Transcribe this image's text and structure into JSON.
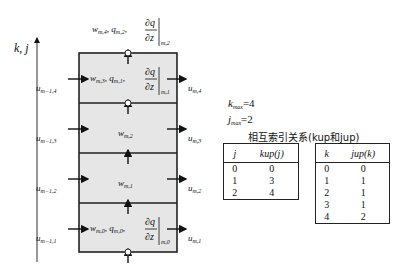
{
  "axis": {
    "label": "k, j"
  },
  "box": {
    "layers": [
      {
        "index": 4,
        "center_label": "w_{m,3}, q_{m,1}, ∂q/∂z|_{m,1}"
      },
      {
        "index": 3,
        "center_label": "w_{m,2}"
      },
      {
        "index": 2,
        "center_label": "w_{m,1}"
      },
      {
        "index": 1,
        "center_label": "w_{m,0}, q_{m,0}, ∂q/∂z|_{m,0}"
      }
    ],
    "top_label": "w_{m,4}, q_{m,2}, ∂q/∂z|_{m,2}"
  },
  "labels": {
    "w_m4": "w",
    "w_m4_sub": "m,4",
    "q_m2": "q",
    "q_m2_sub": "m,2",
    "dq_top_sub": "m,2",
    "w_m3": "w",
    "w_m3_sub": "m,3",
    "q_m1": "q",
    "q_m1_sub": "m,1",
    "dq_mid_sub": "m,1",
    "w_m2": "w",
    "w_m2_sub": "m,2",
    "w_m1": "w",
    "w_m1_sub": "m,1",
    "w_m0": "w",
    "w_m0_sub": "m,0",
    "q_m0": "q",
    "q_m0_sub": "m,0",
    "dq_bot_sub": "m,0",
    "dq_num": "∂q",
    "dq_den": "∂z",
    "comma": ","
  },
  "inflow": [
    {
      "sym": "u",
      "sub": "m−1,4"
    },
    {
      "sym": "u",
      "sub": "m−1,3"
    },
    {
      "sym": "u",
      "sub": "m−1,2"
    },
    {
      "sym": "u",
      "sub": "m−1,1"
    }
  ],
  "outflow": [
    {
      "sym": "u",
      "sub": "m,4"
    },
    {
      "sym": "u",
      "sub": "m,3"
    },
    {
      "sym": "u",
      "sub": "m,2"
    },
    {
      "sym": "u",
      "sub": "m,1"
    }
  ],
  "params": {
    "kmax_sym": "k",
    "kmax_sub": "max",
    "kmax_val": "=4",
    "jmax_sym": "j",
    "jmax_sub": "max",
    "jmax_val": "=2"
  },
  "tables_title": "相互索引关系(kup和jup)",
  "table_kup": {
    "headers": [
      "j",
      "kup(j)"
    ],
    "rows": [
      [
        "0",
        "0"
      ],
      [
        "1",
        "3"
      ],
      [
        "2",
        "4"
      ]
    ]
  },
  "table_jup": {
    "headers": [
      "k",
      "jup(k)"
    ],
    "rows": [
      [
        "0",
        "0"
      ],
      [
        "1",
        "1"
      ],
      [
        "2",
        "1"
      ],
      [
        "3",
        "1"
      ],
      [
        "4",
        "2"
      ]
    ]
  }
}
